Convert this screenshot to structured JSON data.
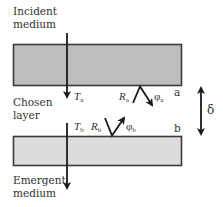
{
  "diagram": {
    "media": {
      "incident": [
        "Incident",
        "medium"
      ],
      "chosen": [
        "Chosen",
        "layer"
      ],
      "emergent": [
        "Emergent",
        "medium"
      ]
    },
    "layers": [
      {
        "name": "upper",
        "fill": "#bdbdbd",
        "stroke": "#3a3a3a"
      },
      {
        "name": "lower",
        "fill": "#dcdcdc",
        "stroke": "#3a3a3a"
      }
    ],
    "interfaces": {
      "a": "a",
      "b": "b"
    },
    "symbols": {
      "Ta": {
        "main": "T",
        "sub": "a"
      },
      "Ra": {
        "main": "R",
        "sub": "a"
      },
      "phia": {
        "main": "φ",
        "sub": "a"
      },
      "Tb": {
        "main": "T",
        "sub": "b"
      },
      "Rb": {
        "main": "R",
        "sub": "b"
      },
      "phib": {
        "main": "φ",
        "sub": "b"
      }
    },
    "thickness": "δ"
  }
}
